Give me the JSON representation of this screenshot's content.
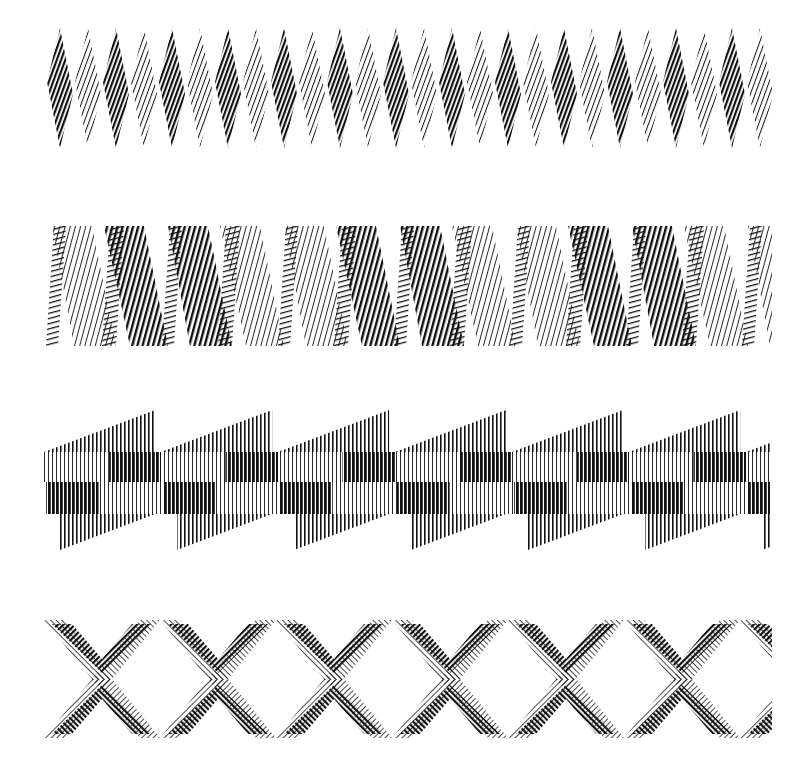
{
  "artwork": {
    "type": "op-art line pattern sheet",
    "background": "#ffffff",
    "ink": "#111111",
    "bands": [
      {
        "id": "diamonds",
        "description": "Row of narrow diamonds filled with diagonal hatch lines, alternating dark and light weight",
        "x": 46,
        "y": 28,
        "width": 726,
        "height": 120,
        "period": 28,
        "count": 26
      },
      {
        "id": "zigzag-ribbon",
        "description": "Folded zigzag ribbon of hatched parallelograms, alternating shading",
        "x": 44,
        "y": 226,
        "width": 728,
        "height": 120,
        "period": 116,
        "count": 7
      },
      {
        "id": "checker-arrows",
        "description": "Horizontal checker strip of vertical lines with triangular arrow fins above and below",
        "x": 44,
        "y": 410,
        "width": 726,
        "height": 140,
        "period": 117,
        "count": 7
      },
      {
        "id": "x-lattice",
        "description": "Lattice of interlocking X shapes and chevrons filled with fine diagonal hatching",
        "x": 44,
        "y": 620,
        "width": 728,
        "height": 118,
        "period": 116,
        "count": 7
      }
    ]
  }
}
